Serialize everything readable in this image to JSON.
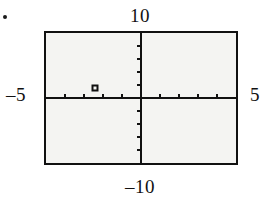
{
  "bullet": {
    "icon": "bullet-dot"
  },
  "labels": {
    "ymax": "10",
    "ymin": "–10",
    "xmin": "–5",
    "xmax": "5"
  },
  "colors": {
    "ink": "#111111",
    "screen_background": "#f4f4f2",
    "page_background": "#ffffff"
  },
  "chart_data": {
    "type": "scatter",
    "title": "",
    "subtitle": "",
    "xlabel": "",
    "ylabel": "",
    "xlim": [
      -5,
      5
    ],
    "ylim": [
      -10,
      10
    ],
    "xtick_labels": [
      "–5",
      "5"
    ],
    "ytick_labels": [
      "–10",
      "10"
    ],
    "xscl": 1,
    "yscl": 2,
    "grid": false,
    "legend": false,
    "legend_position": "none",
    "axes_visible": true,
    "tick_marks": true,
    "xticks": [
      -4,
      -3,
      -2,
      -1,
      1,
      2,
      3,
      4
    ],
    "yticks": [
      -8,
      -6,
      -4,
      -2,
      2,
      4,
      6,
      8
    ],
    "series": [
      {
        "name": "plotted point",
        "marker": "square",
        "x": [
          -2.4
        ],
        "y": [
          1.6
        ],
        "points": [
          {
            "x": -2.4,
            "y": 1.6
          }
        ]
      }
    ],
    "annotations": []
  }
}
